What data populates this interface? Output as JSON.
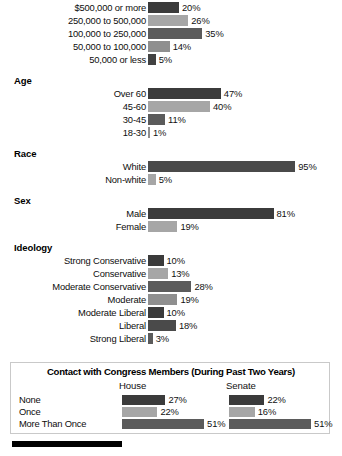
{
  "chart_data": {
    "type": "bar",
    "title": "",
    "xlabel": "",
    "ylabel": "",
    "grid": false,
    "legend": "none",
    "orientation": "horizontal",
    "value_suffix": "%",
    "xlim": [
      0,
      100
    ],
    "groups": [
      {
        "name": "income",
        "title": "",
        "categories": [
          "$500,000 or more",
          "250,000 to 500,000",
          "100,000 to 250,000",
          "50,000 to 100,000",
          "50,000 or less"
        ],
        "values": [
          20,
          26,
          35,
          14,
          5
        ],
        "labels": [
          "20%",
          "26%",
          "35%",
          "14%",
          "5%"
        ],
        "colors": [
          "#3b3b3b",
          "#a6a6a6",
          "#5b5b5b",
          "#8f8f8f",
          "#424242"
        ]
      },
      {
        "name": "age",
        "title": "Age",
        "categories": [
          "Over 60",
          "45-60",
          "30-45",
          "18-30"
        ],
        "values": [
          47,
          40,
          11,
          1
        ],
        "labels": [
          "47%",
          "40%",
          "11%",
          "1%"
        ],
        "colors": [
          "#3b3b3b",
          "#a6a6a6",
          "#5b5b5b",
          "#8f8f8f"
        ]
      },
      {
        "name": "race",
        "title": "Race",
        "categories": [
          "White",
          "Non-white"
        ],
        "values": [
          95,
          5
        ],
        "labels": [
          "95%",
          "5%"
        ],
        "colors": [
          "#4a4a4a",
          "#a6a6a6"
        ]
      },
      {
        "name": "sex",
        "title": "Sex",
        "categories": [
          "Male",
          "Female"
        ],
        "values": [
          81,
          19
        ],
        "labels": [
          "81%",
          "19%"
        ],
        "colors": [
          "#3b3b3b",
          "#a6a6a6"
        ]
      },
      {
        "name": "ideology",
        "title": "Ideology",
        "categories": [
          "Strong Conservative",
          "Conservative",
          "Moderate Conservative",
          "Moderate",
          "Moderate Liberal",
          "Liberal",
          "Strong Liberal"
        ],
        "values": [
          10,
          13,
          28,
          19,
          10,
          18,
          3
        ],
        "labels": [
          "10%",
          "13%",
          "28%",
          "19%",
          "10%",
          "18%",
          "3%"
        ],
        "colors": [
          "#3b3b3b",
          "#a6a6a6",
          "#5b5b5b",
          "#8f8f8f",
          "#3b3b3b",
          "#4a4a4a",
          "#5b5b5b"
        ]
      }
    ],
    "contact_panel": {
      "title": "Contact with Congress Members (During Past Two Years)",
      "column_headers": [
        "House",
        "Senate"
      ],
      "categories": [
        "None",
        "Once",
        "More Than Once"
      ],
      "series": [
        {
          "name": "House",
          "values": [
            27,
            22,
            51
          ],
          "labels": [
            "27%",
            "22%",
            "51%"
          ]
        },
        {
          "name": "Senate",
          "values": [
            22,
            16,
            51
          ],
          "labels": [
            "22%",
            "16%",
            "51%"
          ]
        }
      ],
      "colors": [
        "#3b3b3b",
        "#a6a6a6",
        "#5b5b5b"
      ]
    }
  }
}
